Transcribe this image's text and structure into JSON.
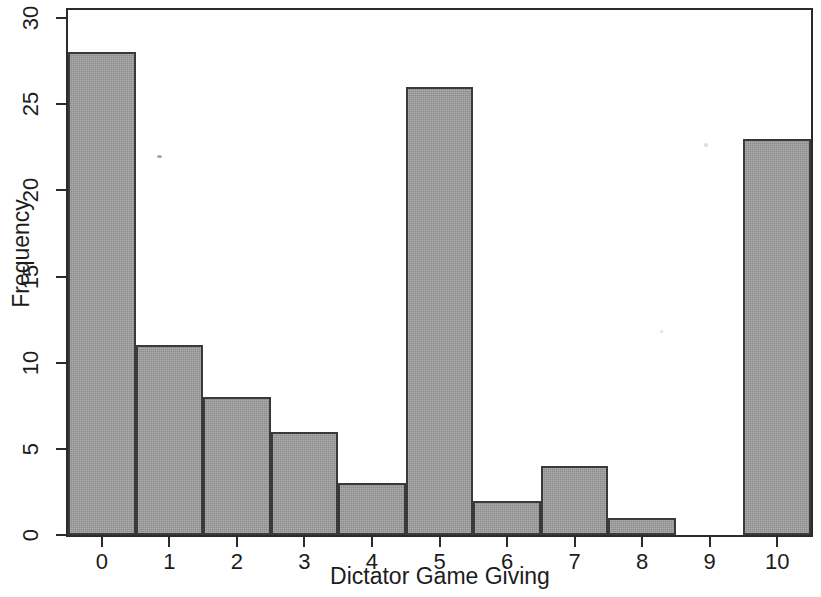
{
  "chart_data": {
    "type": "bar",
    "title": "",
    "subtitle": "",
    "xlabel": "Dictator Game Giving",
    "ylabel": "Frequency",
    "categories": [
      "0",
      "1",
      "2",
      "3",
      "4",
      "5",
      "6",
      "7",
      "8",
      "9",
      "10"
    ],
    "values": [
      28,
      11,
      8,
      6,
      3,
      26,
      2,
      4,
      1,
      0,
      23
    ],
    "series": [
      {
        "name": "Frequency",
        "values": [
          28,
          11,
          8,
          6,
          3,
          26,
          2,
          4,
          1,
          0,
          23
        ]
      }
    ],
    "xlim": [
      -0.5,
      10.5
    ],
    "ylim": [
      0,
      30
    ],
    "ytick_labels": [
      "0",
      "5",
      "10",
      "15",
      "20",
      "25",
      "30"
    ],
    "ytick_values": [
      0,
      5,
      10,
      15,
      20,
      25,
      30
    ],
    "xtick_labels": [
      "0",
      "1",
      "2",
      "3",
      "4",
      "5",
      "6",
      "7",
      "8",
      "9",
      "10"
    ],
    "xtick_values": [
      0,
      1,
      2,
      3,
      4,
      5,
      6,
      7,
      8,
      9,
      10
    ],
    "grid": false,
    "legend": false,
    "legend_position": "none",
    "annotations": [],
    "bar_fill_color": "#9a9a9a",
    "bar_border_color": "#3a3a3a",
    "axis_color": "#2b2b2b",
    "background_color": "#ffffff"
  }
}
